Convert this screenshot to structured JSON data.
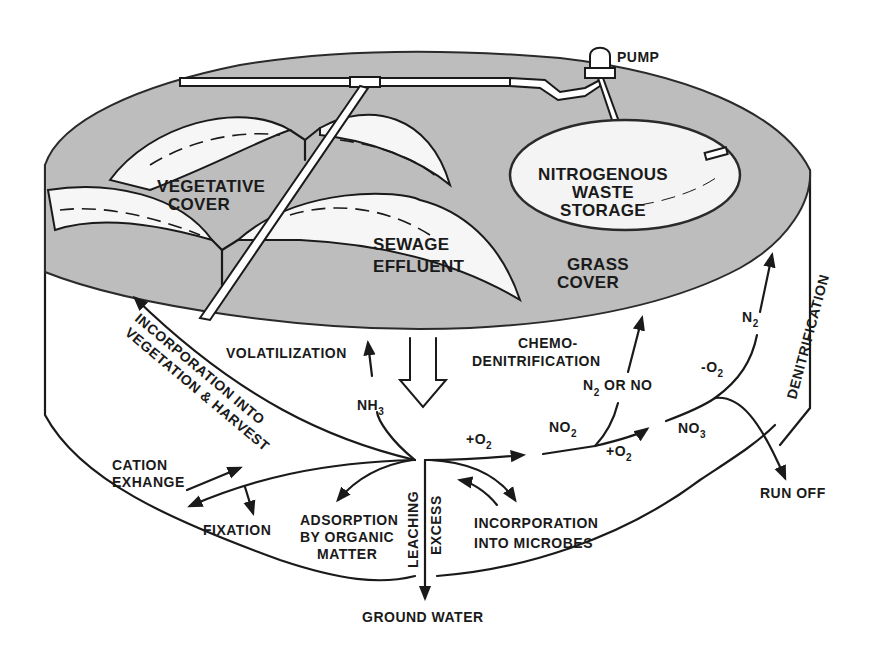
{
  "diagram": {
    "type": "nitrogen-cycle-land-treatment",
    "colors": {
      "ink": "#1a1a1a",
      "grass_fill": "#bdbdbd",
      "background": "#ffffff"
    },
    "surface_labels": {
      "pump": "PUMP",
      "storage_line1": "NITROGENOUS",
      "storage_line2": "WASTE",
      "storage_line3": "STORAGE",
      "vegetative_line1": "VEGETATIVE",
      "vegetative_line2": "COVER",
      "sewage_line1": "SEWAGE",
      "sewage_line2": "EFFLUENT",
      "grass_line1": "GRASS",
      "grass_line2": "COVER"
    },
    "process_labels": {
      "incorporation_veg_line1": "INCORPORATION INTO",
      "incorporation_veg_line2": "VEGETATION & HARVEST",
      "volatilization": "VOLATILIZATION",
      "nh3_main": "NH",
      "nh3_sub": "3",
      "chemo_line1": "CHEMO-",
      "chemo_line2": "DENITRIFICATION",
      "n2_or_no_a": "N",
      "n2_or_no_sub": "2",
      "n2_or_no_b": " OR NO",
      "denitrification": "DENITRIFICATION",
      "n2_main": "N",
      "n2_sub": "2",
      "minus_o2_main": "-O",
      "minus_o2_sub": "2",
      "plus_o2_a_main": "+O",
      "plus_o2_a_sub": "2",
      "no2_main": "NO",
      "no2_sub": "2",
      "plus_o2_b_main": "+O",
      "plus_o2_b_sub": "2",
      "no3_main": "NO",
      "no3_sub": "3",
      "run_off": "RUN OFF",
      "cation_line1": "CATION",
      "cation_line2": "EXHANGE",
      "fixation": "FIXATION",
      "adsorption_line1": "ADSORPTION",
      "adsorption_line2": "BY ORGANIC",
      "adsorption_line3": "MATTER",
      "leaching": "LEACHING",
      "excess": "EXCESS",
      "microbes_line1": "INCORPORATION",
      "microbes_line2": "INTO MICROBES",
      "ground_water": "GROUND WATER"
    }
  }
}
